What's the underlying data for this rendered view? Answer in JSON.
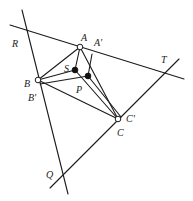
{
  "diagram": {
    "colors": {
      "stroke": "#1a1a1a",
      "background": "#ffffff",
      "open_point_fill": "#ffffff",
      "solid_point_fill": "#111111"
    },
    "points": {
      "A": {
        "label": "A",
        "x": 80,
        "y": 47,
        "style": "open"
      },
      "B": {
        "label": "B",
        "x": 38,
        "y": 80,
        "style": "open"
      },
      "C": {
        "label": "C",
        "x": 118,
        "y": 119,
        "style": "open"
      },
      "S": {
        "label": "S",
        "x": 75,
        "y": 70,
        "style": "solid"
      },
      "P": {
        "label": "P",
        "x": 88,
        "y": 76,
        "style": "solid"
      },
      "A_prime": {
        "label": "A'",
        "x": 92,
        "y": 54
      },
      "B_prime": {
        "label": "B'",
        "x": 40,
        "y": 84
      },
      "C_prime": {
        "label": "C'",
        "x": 121,
        "y": 117
      },
      "R": {
        "label": "R",
        "x": 27,
        "y": 30
      },
      "T": {
        "label": "T",
        "x": 164,
        "y": 72
      },
      "Q": {
        "label": "Q",
        "x": 63,
        "y": 175
      }
    },
    "labels": [
      {
        "text": "R",
        "x": 12,
        "y": 47
      },
      {
        "text": "A",
        "x": 81,
        "y": 41
      },
      {
        "text": "A'",
        "x": 94,
        "y": 46
      },
      {
        "text": "T",
        "x": 161,
        "y": 63
      },
      {
        "text": "S",
        "x": 64,
        "y": 72
      },
      {
        "text": "B",
        "x": 24,
        "y": 87
      },
      {
        "text": "P",
        "x": 76,
        "y": 93
      },
      {
        "text": "B'",
        "x": 28,
        "y": 101
      },
      {
        "text": "C'",
        "x": 126,
        "y": 122
      },
      {
        "text": "C",
        "x": 117,
        "y": 136
      },
      {
        "text": "Q",
        "x": 46,
        "y": 178
      }
    ],
    "lines": [
      {
        "name": "line-RT",
        "x1": 10,
        "y1": 25,
        "x2": 184,
        "y2": 79
      },
      {
        "name": "line-RQ",
        "x1": 22,
        "y1": 10,
        "x2": 68,
        "y2": 194
      },
      {
        "name": "line-QT",
        "x1": 50,
        "y1": 188,
        "x2": 179,
        "y2": 59
      },
      {
        "name": "segment-AB",
        "x1": 80,
        "y1": 47,
        "x2": 38,
        "y2": 80
      },
      {
        "name": "segment-AC",
        "x1": 80,
        "y1": 47,
        "x2": 118,
        "y2": 119
      },
      {
        "name": "segment-BC",
        "x1": 38,
        "y1": 80,
        "x2": 118,
        "y2": 119
      },
      {
        "name": "segment-AS",
        "x1": 80,
        "y1": 47,
        "x2": 75,
        "y2": 70
      },
      {
        "name": "segment-BS",
        "x1": 38,
        "y1": 80,
        "x2": 75,
        "y2": 70
      },
      {
        "name": "segment-SC",
        "x1": 75,
        "y1": 70,
        "x2": 118,
        "y2": 119
      },
      {
        "name": "segment-AprimeP",
        "x1": 92,
        "y1": 54,
        "x2": 88,
        "y2": 76
      },
      {
        "name": "segment-BprimeP",
        "x1": 40,
        "y1": 84,
        "x2": 88,
        "y2": 76
      },
      {
        "name": "segment-PCprime",
        "x1": 88,
        "y1": 76,
        "x2": 121,
        "y2": 117
      }
    ]
  }
}
